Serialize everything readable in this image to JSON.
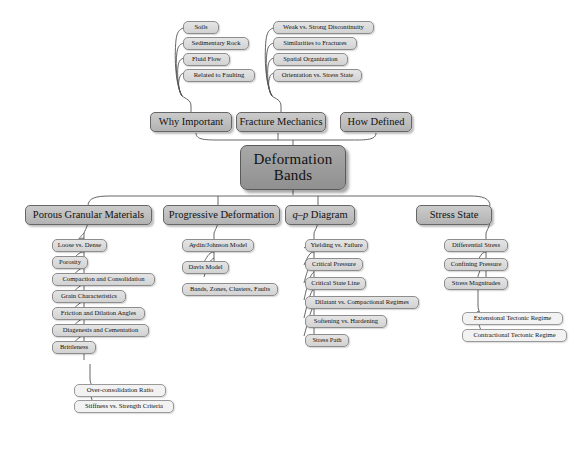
{
  "diagram": {
    "type": "mind-map",
    "title": "Deformation Bands",
    "root": {
      "line1": "Deformation",
      "line2": "Bands"
    },
    "upper_branches": [
      {
        "label": "Why Important",
        "children": [
          "Soils",
          "Sedimentary Rock",
          "Fluid Flow",
          "Related to Faulting"
        ]
      },
      {
        "label": "Fracture Mechanics",
        "children": [
          "Weak vs. Strong Discontinuity",
          "Similarities to Fractures",
          "Spatial Organization",
          "Orientation vs. Stress State"
        ]
      },
      {
        "label": "How Defined",
        "children": []
      }
    ],
    "lower_branches": [
      {
        "label": "Porous Granular Materials",
        "children": [
          "Loose vs. Dense",
          "Porosity",
          "Compaction and Consolidation",
          "Grain Characteristics",
          "Friction and Dilation Angles",
          "Diagenesis and Cementation",
          "Brittleness"
        ],
        "grandchildren_of_last": [
          "Over-consolidation Ratio",
          "Stiffness vs. Strength Criteria"
        ]
      },
      {
        "label": "Progressive Deformation",
        "children": [
          "Aydin/Johnson Model",
          "Davis Model",
          "Bands, Zones, Clusters, Faults"
        ],
        "grandchildren_of_last": []
      },
      {
        "label_part_italic": "q–p",
        "label_part_rest": " Diagram",
        "children": [
          "Yielding vs. Failure",
          "Critical Pressure",
          "Critical State Line",
          "Dilatant vs. Compactional Regimes",
          "Softening vs. Hardening",
          "Stress Path"
        ],
        "grandchildren_of_last": []
      },
      {
        "label": "Stress State",
        "children": [
          "Differential Stress",
          "Confining Pressure",
          "Stress Magnitudes"
        ],
        "grandchildren_of_last": [
          "Extensional Tectonic Regime",
          "Contractional Tectonic Regime"
        ]
      }
    ],
    "colors": {
      "root_fill": "#9b9b9b",
      "branch_fill": "#bdbdbd",
      "leaf_fill": "#dadada",
      "subleaf_fill": "#f2f2f2",
      "line": "#555555",
      "background": "#ffffff"
    }
  }
}
